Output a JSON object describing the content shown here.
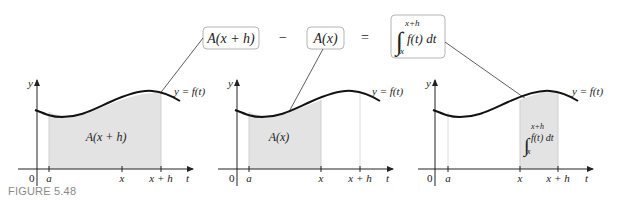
{
  "equation": {
    "term1": "A(x + h)",
    "minus": "−",
    "term2": "A(x)",
    "equals": "=",
    "integral": {
      "upper": "x+h",
      "lower": "x",
      "integrand": "f(t) dt"
    }
  },
  "panels": [
    {
      "curve_label": "y = f(t)",
      "y_axis": "y",
      "t_axis": "t",
      "ticks": {
        "origin": "0",
        "a": "a",
        "x": "x",
        "xh": "x + h"
      },
      "region_label": "A(x + h)",
      "shaded_from": "a",
      "shaded_to": "x + h"
    },
    {
      "curve_label": "y = f(t)",
      "y_axis": "y",
      "t_axis": "t",
      "ticks": {
        "origin": "0",
        "a": "a",
        "x": "x",
        "xh": "x + h"
      },
      "region_label": "A(x)",
      "shaded_from": "a",
      "shaded_to": "x"
    },
    {
      "curve_label": "y = f(t)",
      "y_axis": "y",
      "t_axis": "t",
      "ticks": {
        "origin": "0",
        "a": "a",
        "x": "x",
        "xh": "x + h"
      },
      "region_label": {
        "upper": "x+h",
        "lower": "x",
        "integrand": "f(t) dt"
      },
      "shaded_from": "x",
      "shaded_to": "x + h"
    }
  ],
  "caption": "FIGURE 5.48",
  "colors": {
    "shade": "#e3e3e3",
    "curve": "#111111",
    "box_border": "#b5b5b5",
    "caption": "#8a8a8a"
  }
}
